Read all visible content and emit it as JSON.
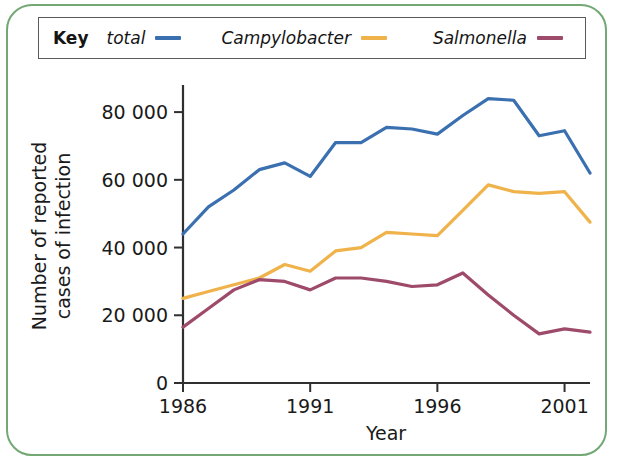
{
  "frame": {
    "border_color": "#73a875"
  },
  "legend": {
    "key_label": "Key",
    "entries": [
      {
        "label": "total",
        "color": "#3a6fb0",
        "icon": "line-swatch"
      },
      {
        "label": "Campylobacter",
        "color": "#f0b24a",
        "icon": "line-swatch"
      },
      {
        "label": "Salmonella",
        "color": "#9e4a6b",
        "icon": "line-swatch"
      }
    ]
  },
  "chart_data": {
    "type": "line",
    "title": "",
    "xlabel": "Year",
    "ylabel": "Number of reported cases of infection",
    "ylabel_line1": "Number of reported",
    "ylabel_line2": "cases of infection",
    "x": [
      1986,
      1987,
      1988,
      1989,
      1990,
      1991,
      1992,
      1993,
      1994,
      1995,
      1996,
      1997,
      1998,
      1999,
      2000,
      2001,
      2002
    ],
    "xtick_values": [
      1986,
      1991,
      1996,
      2001
    ],
    "xtick_labels": [
      "1986",
      "1991",
      "1996",
      "2001"
    ],
    "xlim": [
      1986,
      2002
    ],
    "ytick_values": [
      0,
      20000,
      40000,
      60000,
      80000
    ],
    "ytick_labels": [
      "0",
      "20 000",
      "40 000",
      "60 000",
      "80 000"
    ],
    "ylim": [
      0,
      88000
    ],
    "grid": false,
    "legend_position": "top",
    "series": [
      {
        "name": "total",
        "color": "#3a6fb0",
        "values": [
          44000,
          52000,
          57000,
          63000,
          65000,
          61000,
          71000,
          71000,
          75500,
          75000,
          73500,
          79000,
          84000,
          83500,
          73000,
          74500,
          62000
        ]
      },
      {
        "name": "Campylobacter",
        "color": "#f0b24a",
        "values": [
          25000,
          27000,
          29000,
          31000,
          35000,
          33000,
          39000,
          40000,
          44500,
          44000,
          43500,
          51000,
          58500,
          56500,
          56000,
          56500,
          47500
        ]
      },
      {
        "name": "Salmonella",
        "color": "#9e4a6b",
        "values": [
          16500,
          22000,
          27500,
          30500,
          30000,
          27500,
          31000,
          31000,
          30000,
          28500,
          29000,
          32500,
          26000,
          20000,
          14500,
          16000,
          15000
        ]
      }
    ]
  }
}
